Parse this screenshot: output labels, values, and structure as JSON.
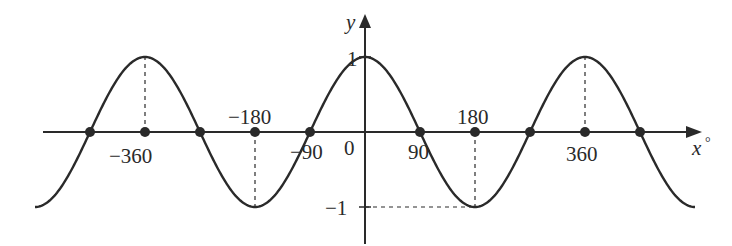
{
  "chart_data": {
    "type": "line",
    "title": "",
    "function": "y = cos x",
    "xlabel": "x°",
    "ylabel": "y",
    "xlim": [
      -540,
      540
    ],
    "ylim": [
      -1,
      1
    ],
    "grid": false,
    "legend": null,
    "x_tick_labels": [
      "-360",
      "-180",
      "-90",
      "0",
      "90",
      "180",
      "360"
    ],
    "y_tick_labels": [
      "1",
      "-1"
    ],
    "marked_points": [
      {
        "x": -450,
        "y": 0
      },
      {
        "x": -360,
        "y": 0
      },
      {
        "x": -270,
        "y": 0
      },
      {
        "x": -180,
        "y": 0
      },
      {
        "x": -90,
        "y": 0
      },
      {
        "x": 90,
        "y": 0
      },
      {
        "x": 180,
        "y": 0
      },
      {
        "x": 270,
        "y": 0
      },
      {
        "x": 360,
        "y": 0
      },
      {
        "x": 450,
        "y": 0
      }
    ],
    "dashed_guides": [
      {
        "from": [
          -360,
          0
        ],
        "to": [
          -360,
          1
        ]
      },
      {
        "from": [
          -180,
          0
        ],
        "to": [
          -180,
          -1
        ]
      },
      {
        "from": [
          180,
          0
        ],
        "to": [
          180,
          -1
        ]
      },
      {
        "from": [
          0,
          -1
        ],
        "to": [
          180,
          -1
        ]
      },
      {
        "from": [
          360,
          0
        ],
        "to": [
          360,
          1
        ]
      }
    ],
    "series": [
      {
        "name": "cos x",
        "x": [
          -540,
          -450,
          -360,
          -270,
          -180,
          -90,
          0,
          90,
          180,
          270,
          360,
          450,
          540
        ],
        "values": [
          -1,
          0,
          1,
          0,
          -1,
          0,
          1,
          0,
          -1,
          0,
          1,
          0,
          -1
        ]
      }
    ]
  },
  "labels": {
    "x_axis": "x",
    "x_axis_degree": "°",
    "y_axis": "y",
    "origin": "0",
    "tick_neg360": "−360",
    "tick_neg180": "−180",
    "tick_neg90": "−90",
    "tick_90": "90",
    "tick_180": "180",
    "tick_360": "360",
    "y_tick_1": "1",
    "y_tick_neg1": "−1"
  },
  "colors": {
    "curve": "#2a2a2a",
    "axis": "#2a2a2a",
    "background": "#ffffff"
  }
}
